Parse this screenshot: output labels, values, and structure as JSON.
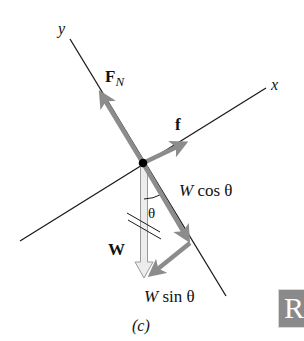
{
  "figure": {
    "caption": "(c)",
    "axes": {
      "x_label": "x",
      "y_label": "y"
    },
    "forces": {
      "normal": {
        "label_main": "F",
        "label_sub": "N"
      },
      "friction": {
        "label": "f"
      },
      "weight": {
        "label": "W"
      },
      "weight_parallel_y": {
        "label_var": "W",
        "label_rest": " cos θ"
      },
      "weight_parallel_x": {
        "label_var": "W",
        "label_rest": " sin θ"
      }
    },
    "angle_label": "θ",
    "colors": {
      "force_arrow": "#8c8c8c",
      "weight_arrow_fill": "#ececec",
      "weight_arrow_stroke": "#9a9a9a",
      "axis_line": "#1a1a1a",
      "dot": "#000000"
    }
  },
  "corner_tab": {
    "text": "R"
  }
}
